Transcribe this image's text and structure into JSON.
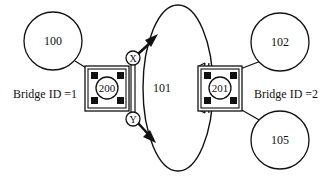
{
  "diagram": {
    "nodes": {
      "lan_100": {
        "label": "100"
      },
      "lan_101": {
        "label": "101"
      },
      "lan_102": {
        "label": "102"
      },
      "lan_105": {
        "label": "105"
      },
      "bridge_200": {
        "label": "200"
      },
      "bridge_201": {
        "label": "201"
      },
      "port_x": {
        "label": "X"
      },
      "port_y": {
        "label": "Y"
      }
    },
    "labels": {
      "bridge_1": "Bridge ID =1",
      "bridge_2": "Bridge ID =2"
    },
    "colors": {
      "stroke": "#111111",
      "fill": "#ffffff",
      "port_fill": "#111111"
    }
  }
}
